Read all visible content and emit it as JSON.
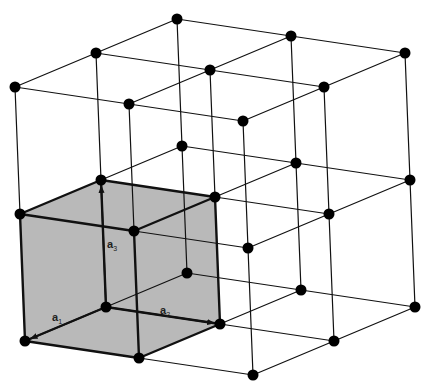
{
  "diagram": {
    "type": "crystal-lattice",
    "colors": {
      "background": "#ffffff",
      "lines": "#111111",
      "nodes": "#000000",
      "unit_cell_fill": "#b9b9b9"
    },
    "origin": [
      106,
      307
    ],
    "basis_px": {
      "a1": [
        -81,
        34
      ],
      "a2": [
        114,
        17
      ],
      "a3": [
        -5,
        -127
      ]
    },
    "index_range": {
      "a1": [
        -1,
        1
      ],
      "a2": [
        0,
        2
      ],
      "a3": [
        0,
        2
      ]
    },
    "unit_cell": {
      "i": [
        0,
        1
      ],
      "j": [
        0,
        1
      ],
      "k": [
        0,
        1
      ]
    },
    "vectors": [
      {
        "name": "a1",
        "label": "a",
        "sub": "1",
        "label_pos": [
          52,
          311
        ]
      },
      {
        "name": "a2",
        "label": "a",
        "sub": "2",
        "label_pos": [
          160,
          304
        ]
      },
      {
        "name": "a3",
        "label": "a",
        "sub": "3",
        "label_pos": [
          107,
          238
        ]
      }
    ]
  }
}
